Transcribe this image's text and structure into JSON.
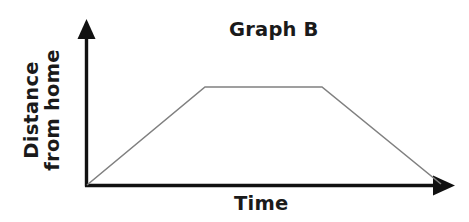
{
  "figure": {
    "width": 469,
    "height": 222,
    "background": "#ffffff"
  },
  "title": "Graph B",
  "axes": {
    "x_label": "Time",
    "y_label_line1": "Distance",
    "y_label_line2": "from home",
    "axis_color": "#111111",
    "arrowheads": [
      "x-axis-right",
      "y-axis-top"
    ],
    "tick_labels_x": [],
    "tick_labels_y": [],
    "grid": false
  },
  "chart_data": {
    "type": "line",
    "title": "Graph B",
    "xlabel": "Time",
    "ylabel": "Distance from home",
    "grid": false,
    "legend": null,
    "xlim": [
      0,
      1
    ],
    "ylim": [
      0,
      1
    ],
    "axis_units": "unlabeled",
    "series": [
      {
        "name": "Distance from home",
        "color": "#808080",
        "line_width": 1.6,
        "x": [
          0.0,
          0.33,
          0.65,
          0.97
        ],
        "y": [
          0.0,
          1.0,
          1.0,
          0.0
        ],
        "points_px": [
          {
            "x": 87,
            "y": 185
          },
          {
            "x": 205,
            "y": 87
          },
          {
            "x": 322,
            "y": 87
          },
          {
            "x": 441,
            "y": 184
          }
        ],
        "description": "Travels away from home at a steady rate, stays at a constant distance, then returns home at a steady rate."
      }
    ]
  },
  "colors": {
    "line": "#808080",
    "axis": "#111111",
    "text": "#1a1a1a",
    "background": "#ffffff"
  }
}
